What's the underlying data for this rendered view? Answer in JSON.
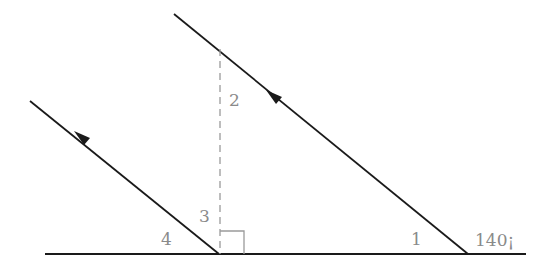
{
  "diagram": {
    "type": "geometry-parallel-lines",
    "colors": {
      "line": "#1a1a1a",
      "dashed": "#9a9a9a",
      "label": "#8a8a8a"
    },
    "labels": {
      "angle1": "1",
      "angle2": "2",
      "angle3": "3",
      "angle4": "4",
      "given_angle": "140¡"
    },
    "lines": {
      "ground": {
        "x1": 45,
        "y1": 254,
        "x2": 526,
        "y2": 254
      },
      "upper_transversal": {
        "x1": 174,
        "y1": 14,
        "x2": 468,
        "y2": 254
      },
      "lower_transversal": {
        "x1": 30,
        "y1": 101,
        "x2": 219,
        "y2": 254
      },
      "perpendicular": {
        "x1": 220,
        "y1": 49,
        "x2": 220,
        "y2": 254
      }
    }
  }
}
